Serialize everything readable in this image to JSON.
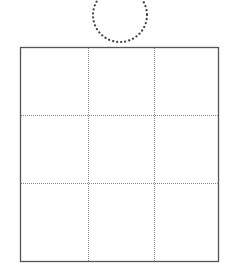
{
  "diagram": {
    "circle": {
      "cx": 120,
      "cy": 15,
      "r": 27,
      "style": "dotted",
      "color": "#444444"
    },
    "grid": {
      "x": 20,
      "y": 47,
      "width": 199,
      "height": 215,
      "rows": 3,
      "cols": 3,
      "border_color": "#555555",
      "divider_color": "#888888",
      "col_dividers": [
        88,
        154
      ],
      "row_dividers": [
        115,
        183
      ]
    }
  }
}
